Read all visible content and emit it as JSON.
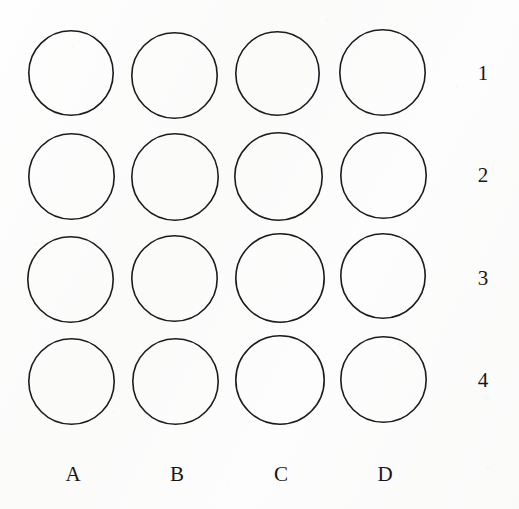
{
  "figure": {
    "kind": "circle-grid-diagram",
    "background_color": "#fcfcfb",
    "stroke_color": "#1c1c20",
    "stroke_width_px": 1.6,
    "rows": 4,
    "columns": 4
  },
  "column_labels": [
    {
      "label": "A",
      "x": 73
    },
    {
      "label": "B",
      "x": 177
    },
    {
      "label": "C",
      "x": 281
    },
    {
      "label": "D",
      "x": 385
    }
  ],
  "row_labels": [
    {
      "label": "1",
      "y": 63
    },
    {
      "label": "2",
      "y": 165
    },
    {
      "label": "3",
      "y": 268
    },
    {
      "label": "4",
      "y": 370
    }
  ],
  "circles": [
    {
      "id": "A1",
      "column": "A",
      "row": "1",
      "cx": 71,
      "cy": 73,
      "d": 86,
      "filled": false
    },
    {
      "id": "B1",
      "column": "B",
      "row": "1",
      "cx": 174,
      "cy": 75,
      "d": 87,
      "filled": false
    },
    {
      "id": "C1",
      "column": "C",
      "row": "1",
      "cx": 277,
      "cy": 73,
      "d": 85,
      "filled": false
    },
    {
      "id": "D1",
      "column": "D",
      "row": "1",
      "cx": 382,
      "cy": 72,
      "d": 87,
      "filled": false
    },
    {
      "id": "A2",
      "column": "A",
      "row": "2",
      "cx": 71,
      "cy": 176,
      "d": 87,
      "filled": false
    },
    {
      "id": "B2",
      "column": "B",
      "row": "2",
      "cx": 175,
      "cy": 177,
      "d": 88,
      "filled": false
    },
    {
      "id": "C2",
      "column": "C",
      "row": "2",
      "cx": 278,
      "cy": 176,
      "d": 89,
      "filled": false
    },
    {
      "id": "D2",
      "column": "D",
      "row": "2",
      "cx": 383,
      "cy": 175,
      "d": 87,
      "filled": false
    },
    {
      "id": "A3",
      "column": "A",
      "row": "3",
      "cx": 70,
      "cy": 279,
      "d": 87,
      "filled": false
    },
    {
      "id": "B3",
      "column": "B",
      "row": "3",
      "cx": 174,
      "cy": 278,
      "d": 87,
      "filled": false
    },
    {
      "id": "C3",
      "column": "C",
      "row": "3",
      "cx": 280,
      "cy": 278,
      "d": 90,
      "filled": false
    },
    {
      "id": "D3",
      "column": "D",
      "row": "3",
      "cx": 383,
      "cy": 276,
      "d": 86,
      "filled": false
    },
    {
      "id": "A4",
      "column": "A",
      "row": "4",
      "cx": 71,
      "cy": 381,
      "d": 87,
      "filled": false
    },
    {
      "id": "B4",
      "column": "B",
      "row": "4",
      "cx": 175,
      "cy": 381,
      "d": 87,
      "filled": false
    },
    {
      "id": "C4",
      "column": "C",
      "row": "4",
      "cx": 280,
      "cy": 380,
      "d": 90,
      "filled": false
    },
    {
      "id": "D4",
      "column": "D",
      "row": "4",
      "cx": 383,
      "cy": 379,
      "d": 87,
      "filled": false
    }
  ]
}
